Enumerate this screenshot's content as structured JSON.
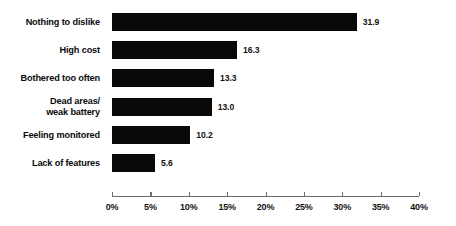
{
  "chart_data": {
    "type": "bar",
    "orientation": "horizontal",
    "title": "",
    "subtitle": "",
    "xlabel": "",
    "ylabel": "",
    "xlim": [
      0,
      40
    ],
    "grid": false,
    "legend": null,
    "bar_color": "#090909",
    "axis_color": "#6e6e6e",
    "background": "#ffffff",
    "categories": [
      "Nothing to dislike",
      "High cost",
      "Bothered too often",
      "Dead areas/ weak battery",
      "Feeling monitored",
      "Lack of features"
    ],
    "category_lines": [
      [
        "Nothing to dislike"
      ],
      [
        "High cost"
      ],
      [
        "Bothered too often"
      ],
      [
        "Dead areas/",
        "weak battery"
      ],
      [
        "Feeling monitored"
      ],
      [
        "Lack of features"
      ]
    ],
    "values": [
      31.9,
      16.3,
      13.3,
      13.0,
      10.2,
      5.6
    ],
    "value_labels": [
      "31.9",
      "16.3",
      "13.3",
      "13.0",
      "10.2",
      "5.6"
    ],
    "xticks": [
      0,
      5,
      10,
      15,
      20,
      25,
      30,
      35,
      40
    ],
    "xtick_labels": [
      "0%",
      "5%",
      "10%",
      "15%",
      "20%",
      "25%",
      "30%",
      "35%",
      "40%"
    ]
  }
}
